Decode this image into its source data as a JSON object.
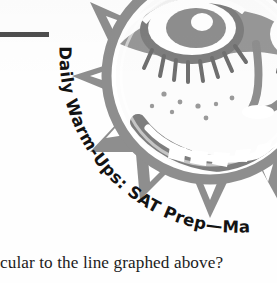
{
  "page": {
    "background_color": "#fefefe",
    "width": 277,
    "height": 283
  },
  "rule": {
    "name": "horizontal-rule",
    "color": "#4e4e4e"
  },
  "title": {
    "full_text": "Daily Warm-Ups: SAT Prep—Math",
    "series": "Daily Warm-Ups",
    "subject": "SAT Prep—Math",
    "color": "#131313",
    "orientation": "curved-arc"
  },
  "artwork": {
    "name": "sun-face-woodcut",
    "description": "Decorative woodcut illustration of a sun with a face and jagged triangular rays",
    "ink_color": "#8e8e8e",
    "ink_color_dark": "#6f6f6f",
    "highlight_color": "#ffffff"
  },
  "body": {
    "text_line": "cular to the line graphed above?",
    "color": "#1c1c1c"
  }
}
